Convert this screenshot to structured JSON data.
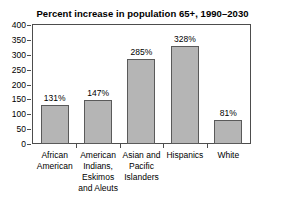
{
  "chart_data": {
    "type": "bar",
    "title": "Percent increase in population 65+, 1990–2030",
    "xlabel": "",
    "ylabel": "",
    "ylim": [
      0,
      400
    ],
    "yticks": [
      400,
      350,
      300,
      250,
      200,
      150,
      100,
      50,
      0
    ],
    "ytick_labels": [
      "400",
      "350",
      "300",
      "250",
      "200",
      "150",
      "100",
      "50",
      "0"
    ],
    "grid": false,
    "legend": false,
    "categories": [
      "African American",
      "American Indians, Eskimos and Aleuts",
      "Asian and Pacific Islanders",
      "Hispanics",
      "White"
    ],
    "category_label_lines": [
      [
        "African",
        "American"
      ],
      [
        "American",
        "Indians,",
        "Eskimos",
        "and Aleuts"
      ],
      [
        "Asian and",
        "Pacific",
        "Islanders"
      ],
      [
        "Hispanics"
      ],
      [
        "White"
      ]
    ],
    "values": [
      131,
      147,
      285,
      328,
      81
    ],
    "data_labels": [
      "131%",
      "147%",
      "285%",
      "328%",
      "81%"
    ],
    "bar_color": "#b5b5b5",
    "bar_edge_color": "#5a5a5a",
    "axis_color": "#4d4d4d",
    "background_color": "#ffffff",
    "text_color": "#000000"
  }
}
